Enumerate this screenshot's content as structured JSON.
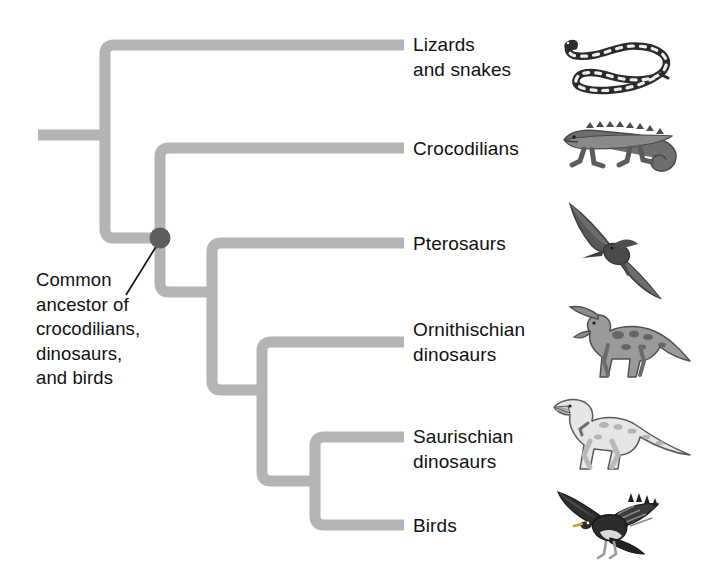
{
  "diagram": {
    "branch_color": "#b4b4b4",
    "node_color": "#5e5e5e",
    "text_color": "#111111",
    "background_color": "#ffffff",
    "branch_thickness_px": 11
  },
  "annotation": {
    "ancestor_caption": "Common\nancestor of\ncrocodilians,\ndinosaurs,\nand birds",
    "leader_line": "points from caption to the common-ancestor node"
  },
  "taxa": [
    {
      "label": "Lizards\nand snakes",
      "tip_y": 45,
      "icon": "coiled-snake-illustration"
    },
    {
      "label": "Crocodilians",
      "tip_y": 148,
      "icon": "crocodile-illustration"
    },
    {
      "label": "Pterosaurs",
      "tip_y": 243,
      "icon": "pterosaur-illustration"
    },
    {
      "label": "Ornithischian\ndinosaurs",
      "tip_y": 342,
      "icon": "hadrosaur-illustration"
    },
    {
      "label": "Saurischian\ndinosaurs",
      "tip_y": 437,
      "icon": "theropod-illustration"
    },
    {
      "label": "Birds",
      "tip_y": 525,
      "icon": "eagle-illustration"
    }
  ],
  "nodes": [
    {
      "name": "root-node",
      "x": 105,
      "y": 135,
      "marked": false
    },
    {
      "name": "archosaur-ancestor",
      "x": 160,
      "y": 238,
      "marked": true
    },
    {
      "name": "ornithodira-node",
      "x": 212,
      "y": 292,
      "marked": false
    },
    {
      "name": "dinosauria-node",
      "x": 262,
      "y": 390,
      "marked": false
    },
    {
      "name": "saurischia-node",
      "x": 315,
      "y": 481,
      "marked": false
    }
  ]
}
